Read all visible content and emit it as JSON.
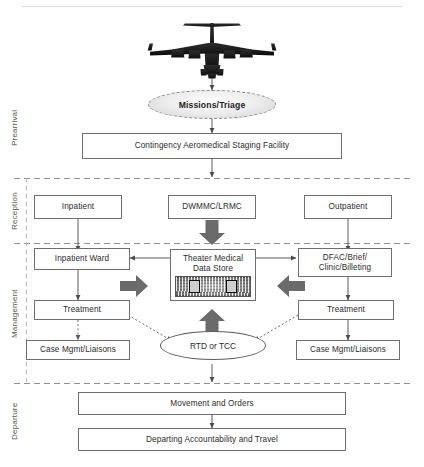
{
  "diagram": {
    "type": "swimlane-flowchart",
    "colors": {
      "box_border": "#6e6e6e",
      "lane_divider": "#8f8f8f",
      "connector": "#5a5a5a",
      "block_arrow": "#6b6b6b",
      "ellipse_fill": "#e8e8e8",
      "text": "#2b2b2b",
      "lane_label": "#555555"
    }
  },
  "lanes": [
    {
      "id": "prearrival",
      "label": "Prearrival"
    },
    {
      "id": "reception",
      "label": "Reception"
    },
    {
      "id": "management",
      "label": "Management"
    },
    {
      "id": "departure",
      "label": "Departure"
    }
  ],
  "nodes": {
    "aircraft": {
      "label": "aircraft-icon"
    },
    "missions_triage": {
      "label": "Missions/Triage",
      "shape": "ellipse-dashed"
    },
    "casf": {
      "label": "Contingency Aeromedical Staging Facility",
      "shape": "box"
    },
    "inpatient": {
      "label": "Inpatient",
      "shape": "box"
    },
    "dwmmc_lrmc": {
      "label": "DWMMC/LRMC",
      "shape": "box"
    },
    "outpatient": {
      "label": "Outpatient",
      "shape": "box"
    },
    "inpatient_ward": {
      "label": "Inpatient Ward",
      "shape": "box"
    },
    "theater_medical_data_store": {
      "line1": "Theater Medical",
      "line2": "Data Store",
      "shape": "box-with-image",
      "image": "globe-network-icon"
    },
    "dfac_brief": {
      "line1": "DFAC/Brief/",
      "line2": "Clinic/Billeting",
      "shape": "box"
    },
    "treatment_left": {
      "label": "Treatment",
      "shape": "box"
    },
    "treatment_right": {
      "label": "Treatment",
      "shape": "box"
    },
    "case_mgmt_left": {
      "label": "Case Mgmt/Liaisons",
      "shape": "box"
    },
    "case_mgmt_right": {
      "label": "Case Mgmt/Liaisons",
      "shape": "box"
    },
    "rtd_or_tcc": {
      "label": "RTD or TCC",
      "shape": "ellipse"
    },
    "movement_and_orders": {
      "label": "Movement and Orders",
      "shape": "box"
    },
    "departing_accountability": {
      "label": "Departing Accountability and Travel",
      "shape": "box"
    }
  },
  "edges": [
    {
      "from": "aircraft",
      "to": "missions_triage",
      "style": "solid-arrow"
    },
    {
      "from": "missions_triage",
      "to": "casf",
      "style": "solid-arrow"
    },
    {
      "from": "casf",
      "to": "reception-lane",
      "style": "solid-arrow"
    },
    {
      "from": "inpatient",
      "to": "inpatient_ward",
      "style": "solid-arrow"
    },
    {
      "from": "dwmmc_lrmc",
      "to": "theater_medical_data_store",
      "style": "block-arrow-down"
    },
    {
      "from": "outpatient",
      "to": "dfac_brief",
      "style": "solid-arrow"
    },
    {
      "from": "theater_medical_data_store",
      "to": "inpatient_ward",
      "style": "solid-arrow-left"
    },
    {
      "from": "theater_medical_data_store",
      "to": "dfac_brief",
      "style": "solid-arrow-right"
    },
    {
      "from": "inpatient_ward",
      "to": "treatment_left",
      "style": "solid-arrow"
    },
    {
      "from": "dfac_brief",
      "to": "treatment_right",
      "style": "solid-arrow"
    },
    {
      "from": "treatment_left",
      "to": "case_mgmt_left",
      "style": "dotted-arrow"
    },
    {
      "from": "treatment_right",
      "to": "case_mgmt_right",
      "style": "solid-arrow"
    },
    {
      "from": "treatment_left",
      "to": "rtd_or_tcc",
      "style": "dotted-arrow"
    },
    {
      "from": "treatment_right",
      "to": "rtd_or_tcc",
      "style": "dotted-arrow"
    },
    {
      "from": "rtd_or_tcc",
      "to": "theater_medical_data_store",
      "style": "block-arrow-up"
    },
    {
      "from": "left-column",
      "to": "theater_medical_data_store",
      "style": "block-arrow-right"
    },
    {
      "from": "right-column",
      "to": "theater_medical_data_store",
      "style": "block-arrow-left"
    },
    {
      "from": "rtd_or_tcc",
      "to": "movement_and_orders",
      "style": "solid-arrow"
    },
    {
      "from": "movement_and_orders",
      "to": "departing_accountability",
      "style": "solid-arrow"
    }
  ]
}
